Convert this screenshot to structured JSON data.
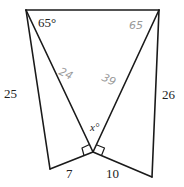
{
  "diagram": {
    "type": "geometry",
    "labels": {
      "angle_top_left": "65°",
      "angle_top_right_handwritten": "65",
      "left_diagonal_handwritten": "24",
      "right_diagonal_handwritten": "39",
      "angle_x": "x°",
      "side_left": "25",
      "side_right": "26",
      "side_bottom_left": "7",
      "side_bottom_right": "10"
    },
    "colors": {
      "stroke": "#1a1a1a",
      "handwriting": "#9a9a9a",
      "background": "#ffffff"
    }
  }
}
